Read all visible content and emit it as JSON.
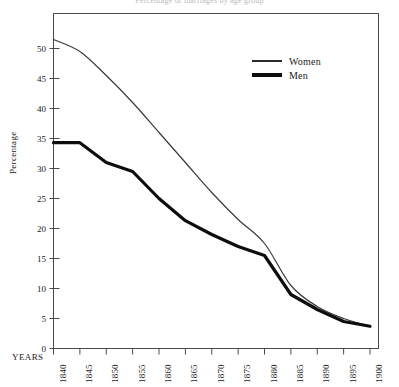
{
  "chart_data": {
    "type": "line",
    "title": "Percentage of marriages by age group",
    "xlabel": "YEARS",
    "ylabel": "Percentage",
    "x": [
      1840,
      1845,
      1850,
      1855,
      1860,
      1865,
      1870,
      1875,
      1880,
      1885,
      1890,
      1895,
      1900
    ],
    "xtick_labels": [
      "1840",
      "1845",
      "1850",
      "1855",
      "1860",
      "1865",
      "1870",
      "1875",
      "1880",
      "1885",
      "1890",
      "1895",
      "1900"
    ],
    "ytick_labels": [
      "0",
      "5",
      "10",
      "15",
      "20",
      "25",
      "30",
      "35",
      "40",
      "45",
      "50"
    ],
    "yticks": [
      0,
      5,
      10,
      15,
      20,
      25,
      30,
      35,
      40,
      45,
      50
    ],
    "ylim": [
      0,
      54
    ],
    "xlim": [
      1840,
      1900
    ],
    "grid": false,
    "legend_position": "upper-right-inside",
    "series": [
      {
        "name": "Women",
        "style": "thin",
        "color": "#3a3a3a",
        "width": 1.2,
        "values": [
          51.5,
          49.5,
          45.5,
          41.0,
          36.0,
          31.0,
          26.0,
          21.5,
          17.5,
          10.5,
          7.0,
          5.0,
          3.7
        ]
      },
      {
        "name": "Men",
        "style": "thick",
        "color": "#0d0d0d",
        "width": 3.2,
        "values": [
          34.3,
          34.3,
          31.0,
          29.5,
          25.0,
          21.3,
          19.0,
          17.0,
          15.5,
          9.0,
          6.5,
          4.5,
          3.7
        ]
      }
    ]
  },
  "legend": {
    "items": [
      {
        "label": "Women"
      },
      {
        "label": "Men"
      }
    ]
  },
  "axes": {
    "y_title": "Percentage",
    "x_title": "YEARS"
  }
}
